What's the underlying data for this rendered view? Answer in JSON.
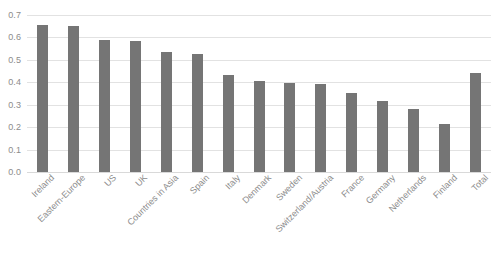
{
  "chart_data": {
    "type": "bar",
    "title": "",
    "subtitle": "",
    "xlabel": "",
    "ylabel": "",
    "ylim": [
      0.0,
      0.7
    ],
    "grid": true,
    "legend": false,
    "legend_position": "none",
    "bar_color": "#757575",
    "gridline_color": "#e2e2e2",
    "tick_label_color": "#8c8c8c",
    "y_ticks": [
      "0.7",
      "0.6",
      "0.5",
      "0.4",
      "0.3",
      "0.2",
      "0.1",
      "0.0"
    ],
    "y_tick_values": [
      0.7,
      0.6,
      0.5,
      0.4,
      0.3,
      0.2,
      0.1,
      0.0
    ],
    "categories": [
      "Ireland",
      "Eastern-Europe",
      "US",
      "UK",
      "Countries in Asia",
      "Spain",
      "Italy",
      "Denmark",
      "Sweden",
      "Switzerland/Austria",
      "France",
      "Germany",
      "Netherlands",
      "Finland",
      "Total"
    ],
    "values": [
      0.655,
      0.653,
      0.59,
      0.585,
      0.535,
      0.525,
      0.432,
      0.408,
      0.397,
      0.393,
      0.353,
      0.318,
      0.283,
      0.215,
      0.442
    ]
  },
  "caption": {
    "text": ""
  }
}
